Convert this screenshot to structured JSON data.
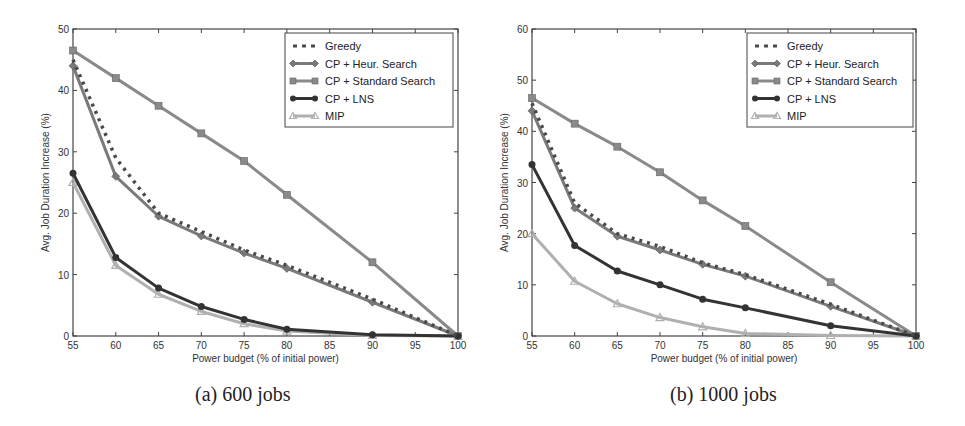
{
  "captions": {
    "a": "(a) 600 jobs",
    "b": "(b) 1000 jobs"
  },
  "legend": [
    {
      "name": "Greedy",
      "style": "dashed",
      "marker": "none",
      "color": "#4a4a4a"
    },
    {
      "name": "CP + Heur. Search",
      "style": "solid",
      "marker": "diamond",
      "color": "#7a7a7a"
    },
    {
      "name": "CP + Standard Search",
      "style": "solid",
      "marker": "square",
      "color": "#8a8a8a"
    },
    {
      "name": "CP + LNS",
      "style": "solid",
      "marker": "circle",
      "color": "#333333"
    },
    {
      "name": "MIP",
      "style": "solid",
      "marker": "triangle",
      "color": "#b0b0b0"
    }
  ],
  "chart_data": [
    {
      "type": "line",
      "title": "(a) 600 jobs",
      "xlabel": "Power budget (% of initial power)",
      "ylabel": "Avg. Job Duration Increase (%)",
      "xlim": [
        55,
        100
      ],
      "ylim": [
        0,
        50
      ],
      "xticks": [
        55,
        60,
        65,
        70,
        75,
        80,
        85,
        90,
        95,
        100
      ],
      "yticks": [
        0,
        10,
        20,
        30,
        40,
        50
      ],
      "grid": false,
      "legend_position": "upper right",
      "x": [
        55,
        60,
        65,
        70,
        75,
        80,
        90,
        100
      ],
      "series": [
        {
          "name": "Greedy",
          "values": [
            45,
            29,
            20,
            17,
            14,
            11.5,
            6,
            0
          ]
        },
        {
          "name": "CP + Heur. Search",
          "values": [
            44,
            26,
            19.5,
            16.3,
            13.5,
            11,
            5.5,
            0
          ]
        },
        {
          "name": "CP + Standard Search",
          "values": [
            46.5,
            42,
            37.5,
            33,
            28.5,
            23,
            12,
            0
          ]
        },
        {
          "name": "CP + LNS",
          "values": [
            26.5,
            12.8,
            7.8,
            4.8,
            2.7,
            1.1,
            0.2,
            0
          ]
        },
        {
          "name": "MIP",
          "values": [
            25,
            11.5,
            6.8,
            4,
            2,
            0.8,
            0.1,
            0
          ]
        }
      ]
    },
    {
      "type": "line",
      "title": "(b) 1000 jobs",
      "xlabel": "Power budget (% of initial power)",
      "ylabel": "Avg. Job Duration Increase (%)",
      "xlim": [
        55,
        100
      ],
      "ylim": [
        0,
        60
      ],
      "xticks": [
        55,
        60,
        65,
        70,
        75,
        80,
        85,
        90,
        95,
        100
      ],
      "yticks": [
        0,
        10,
        20,
        30,
        40,
        50,
        60
      ],
      "grid": false,
      "legend_position": "upper right",
      "x": [
        55,
        60,
        65,
        70,
        75,
        80,
        90,
        100
      ],
      "series": [
        {
          "name": "Greedy",
          "values": [
            45.5,
            26,
            20,
            17.5,
            14.3,
            12,
            6.2,
            0
          ]
        },
        {
          "name": "CP + Heur. Search",
          "values": [
            44,
            25,
            19.5,
            16.8,
            14,
            11.7,
            5.8,
            0
          ]
        },
        {
          "name": "CP + Standard Search",
          "values": [
            46.5,
            41.5,
            37,
            32,
            26.5,
            21.5,
            10.5,
            0
          ]
        },
        {
          "name": "CP + LNS",
          "values": [
            33.5,
            17.7,
            12.7,
            10,
            7.2,
            5.5,
            2,
            0
          ]
        },
        {
          "name": "MIP",
          "values": [
            20,
            10.7,
            6.3,
            3.6,
            1.8,
            0.5,
            0.1,
            0
          ]
        }
      ]
    }
  ]
}
